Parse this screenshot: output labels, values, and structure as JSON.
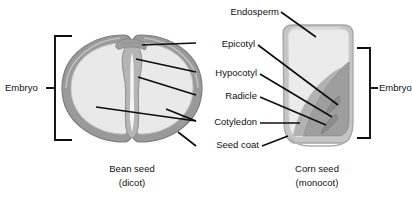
{
  "diagram": {
    "labels": {
      "endosperm": "Endosperm",
      "epicotyl": "Epicotyl",
      "hypocotyl": "Hypocotyl",
      "radicle": "Radicle",
      "cotyledon": "Cotyledon",
      "seed_coat": "Seed coat",
      "embryo_left": "Embryo",
      "embryo_right": "Embryo"
    },
    "captions": {
      "bean_name": "Bean seed",
      "bean_type": "(dicot)",
      "corn_name": "Corn seed",
      "corn_type": "(monocot)"
    },
    "colors": {
      "background": "#ffffff",
      "line": "#0d0d0d",
      "text": "#111111",
      "seed_coat": "#9a9a9a",
      "seed_coat_outline": "#8a8a8a",
      "cotyledon": "#e9e9e9",
      "cotyledon_edge": "#c9c9c9",
      "endosperm": "#ebebeb",
      "corn_embryo": "#9e9e9e",
      "corn_hull": "#c5c5c5",
      "inner_shade": "#b5b5b5"
    }
  }
}
